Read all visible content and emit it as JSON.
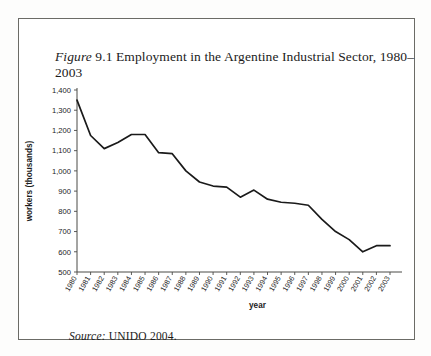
{
  "figure": {
    "caption_label": "Figure",
    "caption_number": "9.1",
    "caption_text": "Employment in the Argentine Industrial Sector, 1980–2003",
    "caption_full": "Figure 9.1 Employment in the Argentine Industrial Sector, 1980–2003",
    "source_label": "Source:",
    "source_text": "UNIDO 2004."
  },
  "chart_data": {
    "type": "line",
    "title": "Employment in the Argentine Industrial Sector, 1980–2003",
    "xlabel": "year",
    "ylabel": "workers (thousands)",
    "x": [
      "1980",
      "1981",
      "1982",
      "1983",
      "1984",
      "1985",
      "1986",
      "1987",
      "1988",
      "1989",
      "1990",
      "1991",
      "1992",
      "1993",
      "1994",
      "1995",
      "1996",
      "1997",
      "1998",
      "1999",
      "2000",
      "2001",
      "2002",
      "2003"
    ],
    "values": [
      1350,
      1175,
      1110,
      1140,
      1180,
      1180,
      1090,
      1085,
      1000,
      945,
      925,
      920,
      870,
      905,
      860,
      845,
      840,
      830,
      760,
      700,
      660,
      600,
      630,
      630
    ],
    "ylim": [
      500,
      1400
    ],
    "ytick_values": [
      500,
      600,
      700,
      800,
      900,
      1000,
      1100,
      1200,
      1300,
      1400
    ],
    "ytick_labels": [
      "500",
      "600",
      "700",
      "800",
      "900",
      "1,000",
      "1,100",
      "1,200",
      "1,300",
      "1,400"
    ],
    "grid": false,
    "legend": "none",
    "series_color": "#1a1a1a",
    "axis_color": "#4a4a46"
  }
}
